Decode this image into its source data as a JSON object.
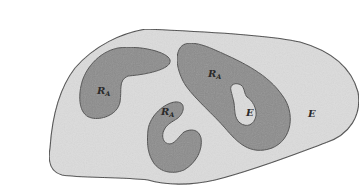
{
  "diagram": {
    "type": "set-region-illustration",
    "colors": {
      "background": "#ffffff",
      "outer_region_fill": "#dcdcdc",
      "inner_region_fill": "#8c8c8c",
      "outline": "#4a4a4a",
      "label": "#2a2a2a"
    },
    "outer_region": {
      "label": "E",
      "label_position": [
        310,
        140
      ]
    },
    "regions": [
      {
        "id": "left-blob",
        "label_main": "R",
        "label_sub": "A",
        "label_position": [
          97,
          88
        ]
      },
      {
        "id": "middle-c",
        "label_main": "R",
        "label_sub": "A",
        "label_position": [
          163,
          113
        ]
      },
      {
        "id": "right-blob",
        "label_main": "R",
        "label_sub": "A",
        "label_position": [
          208,
          74
        ]
      }
    ],
    "holes": [
      {
        "id": "right-blob-hole",
        "label": "E",
        "label_position": [
          247,
          114
        ]
      }
    ]
  }
}
